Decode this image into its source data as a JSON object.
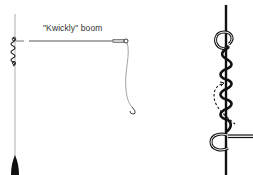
{
  "diagram": {
    "left_panel": {
      "boom_label": "\"Kwickly\" boom",
      "elements": [
        "main-line",
        "knot-attachment",
        "boom-arm",
        "boom-sleeve",
        "hook-line",
        "hook",
        "sinker"
      ]
    },
    "right_panel": {
      "elements": [
        "main-line",
        "upper-loop",
        "wraps",
        "dashed-arrow",
        "lower-loop",
        "tag-end"
      ]
    },
    "colors": {
      "ink": "#111111",
      "line_gray": "#8a8a8a",
      "background": "#ffffff"
    }
  }
}
